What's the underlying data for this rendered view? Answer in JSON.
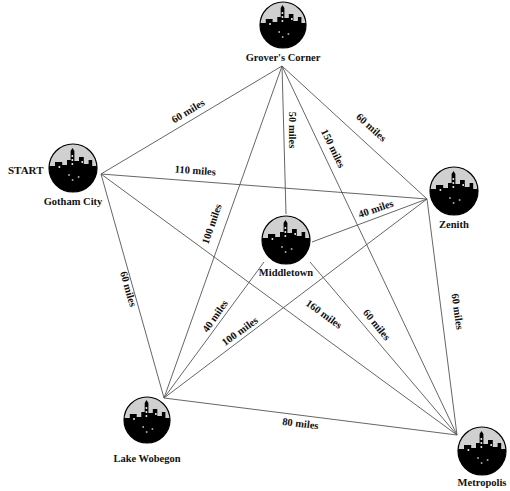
{
  "diagram": {
    "type": "weighted-graph",
    "start_label": "START",
    "start_node": "gotham",
    "colors": {
      "edge": "#555555",
      "sky": "#d0d0d0",
      "city": "#000000",
      "text": "#111111"
    },
    "nodes": [
      {
        "id": "grovers",
        "label": "Grover's Corner",
        "cx": 283,
        "cy": 25,
        "r": 23,
        "lx": 283,
        "ly": 61,
        "ax": 282,
        "ay": 66
      },
      {
        "id": "gotham",
        "label": "Gotham City",
        "cx": 73,
        "cy": 168,
        "r": 24,
        "lx": 73,
        "ly": 205,
        "ax": 101,
        "ay": 174
      },
      {
        "id": "zenith",
        "label": "Zenith",
        "cx": 454,
        "cy": 191,
        "r": 24,
        "lx": 454,
        "ly": 228,
        "ax": 427,
        "ay": 199
      },
      {
        "id": "middletown",
        "label": "Middletown",
        "cx": 286,
        "cy": 240,
        "r": 24,
        "lx": 286,
        "ly": 276,
        "ax": 286,
        "ay": 240
      },
      {
        "id": "lake",
        "label": "Lake Wobegon",
        "cx": 147,
        "cy": 420,
        "r": 23,
        "lx": 147,
        "ly": 462,
        "ax": 164,
        "ay": 398
      },
      {
        "id": "metropolis",
        "label": "Metropolis",
        "cx": 482,
        "cy": 451,
        "r": 24,
        "lx": 482,
        "ly": 486,
        "ax": 457,
        "ay": 435
      }
    ],
    "edges": [
      {
        "from": "gotham",
        "to": "grovers",
        "label": "60 miles",
        "x1": 101,
        "y1": 174,
        "x2": 282,
        "y2": 66,
        "tx": 190,
        "ty": 114,
        "rot": -31
      },
      {
        "from": "gotham",
        "to": "zenith",
        "label": "110 miles",
        "x1": 101,
        "y1": 174,
        "x2": 427,
        "y2": 199,
        "tx": 195,
        "ty": 174,
        "rot": 4
      },
      {
        "from": "gotham",
        "to": "lake",
        "label": "60 miles",
        "x1": 101,
        "y1": 174,
        "x2": 164,
        "y2": 398,
        "tx": 125,
        "ty": 290,
        "rot": 74
      },
      {
        "from": "gotham",
        "to": "metropolis",
        "label": "160 miles",
        "x1": 101,
        "y1": 174,
        "x2": 457,
        "y2": 435,
        "tx": 322,
        "ty": 317,
        "rot": 36
      },
      {
        "from": "grovers",
        "to": "middletown",
        "label": "50 miles",
        "x1": 282,
        "y1": 66,
        "x2": 286,
        "y2": 214,
        "tx": 289,
        "ty": 130,
        "rot": 90
      },
      {
        "from": "grovers",
        "to": "zenith",
        "label": "60 miles",
        "x1": 282,
        "y1": 66,
        "x2": 427,
        "y2": 199,
        "tx": 369,
        "ty": 130,
        "rot": 42
      },
      {
        "from": "grovers",
        "to": "metropolis",
        "label": "150 miles",
        "x1": 282,
        "y1": 66,
        "x2": 457,
        "y2": 435,
        "tx": 330,
        "ty": 150,
        "rot": 64
      },
      {
        "from": "grovers",
        "to": "lake",
        "label": "100 miles",
        "x1": 282,
        "y1": 66,
        "x2": 164,
        "y2": 398,
        "tx": 215,
        "ty": 225,
        "rot": -71
      },
      {
        "from": "zenith",
        "to": "middletown",
        "label": "40 miles",
        "x1": 427,
        "y1": 199,
        "x2": 312,
        "y2": 242,
        "tx": 377,
        "ty": 212,
        "rot": -19
      },
      {
        "from": "zenith",
        "to": "lake",
        "label": "100 miles",
        "x1": 427,
        "y1": 199,
        "x2": 164,
        "y2": 398,
        "tx": 242,
        "ty": 334,
        "rot": -36
      },
      {
        "from": "zenith",
        "to": "metropolis",
        "label": "60 miles",
        "x1": 427,
        "y1": 199,
        "x2": 457,
        "y2": 435,
        "tx": 454,
        "ty": 312,
        "rot": 82
      },
      {
        "from": "middletown",
        "to": "lake",
        "label": "40 miles",
        "x1": 264,
        "y1": 262,
        "x2": 164,
        "y2": 398,
        "tx": 218,
        "ty": 318,
        "rot": -55
      },
      {
        "from": "middletown",
        "to": "metropolis",
        "label": "60 miles",
        "x1": 310,
        "y1": 262,
        "x2": 457,
        "y2": 435,
        "tx": 374,
        "ty": 327,
        "rot": 51
      },
      {
        "from": "lake",
        "to": "metropolis",
        "label": "80 miles",
        "x1": 164,
        "y1": 398,
        "x2": 457,
        "y2": 435,
        "tx": 300,
        "ty": 427,
        "rot": 7
      }
    ]
  }
}
